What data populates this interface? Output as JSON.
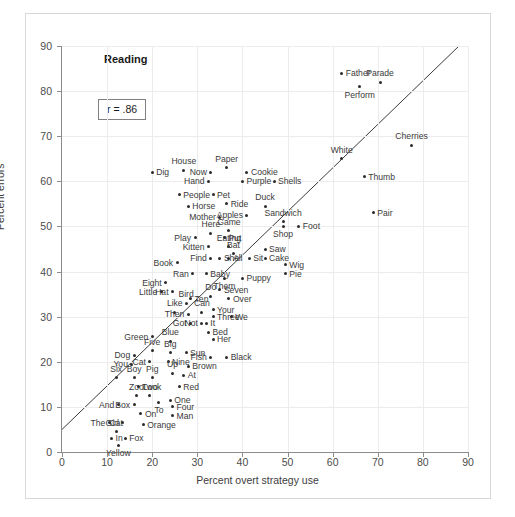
{
  "figure": {
    "title": "Reading",
    "annotation": "r = .86",
    "border_color": "#d8d8d8",
    "point_color": "#2b2b2b",
    "grid_color": "#ececec",
    "axis_color": "#8c8c8c"
  },
  "chart_data": {
    "type": "scatter",
    "title": "Reading",
    "xlabel": "Percent overt strategy use",
    "ylabel": "Percent errors",
    "xlim": [
      0,
      90
    ],
    "ylim": [
      0,
      90
    ],
    "xticks": [
      0,
      10,
      20,
      30,
      40,
      50,
      60,
      70,
      80,
      90
    ],
    "yticks": [
      0,
      10,
      20,
      30,
      40,
      50,
      60,
      70,
      80,
      90
    ],
    "grid": true,
    "legend": "none",
    "annotations": [
      "r = .86"
    ],
    "correlation": 0.86,
    "trendline": {
      "x0": 0,
      "y0": 5,
      "x1": 88,
      "y1": 90
    },
    "points": [
      {
        "label": "Father",
        "x": 62.0,
        "y": 84.0,
        "pos": "r"
      },
      {
        "label": "Parade",
        "x": 70.5,
        "y": 82.0,
        "pos": "t"
      },
      {
        "label": "Perform",
        "x": 66.0,
        "y": 81.0,
        "pos": "b"
      },
      {
        "label": "Cherries",
        "x": 77.5,
        "y": 68.0,
        "pos": "t"
      },
      {
        "label": "White",
        "x": 62.0,
        "y": 65.0,
        "pos": "t"
      },
      {
        "label": "Thumb",
        "x": 67.0,
        "y": 61.0,
        "pos": "r"
      },
      {
        "label": "Pair",
        "x": 69.0,
        "y": 53.0,
        "pos": "r"
      },
      {
        "label": "Dig",
        "x": 20.0,
        "y": 62.0,
        "pos": "r"
      },
      {
        "label": "House",
        "x": 27.0,
        "y": 62.5,
        "pos": "t"
      },
      {
        "label": "Paper",
        "x": 36.5,
        "y": 63.0,
        "pos": "t"
      },
      {
        "label": "Now",
        "x": 33.0,
        "y": 62.0,
        "pos": "l"
      },
      {
        "label": "Cookie",
        "x": 41.0,
        "y": 62.0,
        "pos": "r"
      },
      {
        "label": "Hand",
        "x": 32.5,
        "y": 60.0,
        "pos": "l"
      },
      {
        "label": "Purple",
        "x": 40.0,
        "y": 60.0,
        "pos": "r"
      },
      {
        "label": "Shells",
        "x": 47.0,
        "y": 60.0,
        "pos": "r"
      },
      {
        "label": "People",
        "x": 26.0,
        "y": 57.0,
        "pos": "r"
      },
      {
        "label": "Pet",
        "x": 33.5,
        "y": 57.0,
        "pos": "r"
      },
      {
        "label": "Ride",
        "x": 36.5,
        "y": 55.0,
        "pos": "r"
      },
      {
        "label": "Horse",
        "x": 28.0,
        "y": 54.5,
        "pos": "r"
      },
      {
        "label": "Duck",
        "x": 45.0,
        "y": 54.5,
        "pos": "t"
      },
      {
        "label": "Mother",
        "x": 35.0,
        "y": 52.0,
        "pos": "l"
      },
      {
        "label": "Apples",
        "x": 41.0,
        "y": 52.5,
        "pos": "l"
      },
      {
        "label": "Sandwich",
        "x": 49.0,
        "y": 51.0,
        "pos": "t"
      },
      {
        "label": "Foot",
        "x": 52.5,
        "y": 50.0,
        "pos": "r"
      },
      {
        "label": "Shop",
        "x": 49.0,
        "y": 50.0,
        "pos": "b"
      },
      {
        "label": "Game",
        "x": 37.0,
        "y": 49.0,
        "pos": "t"
      },
      {
        "label": "Here",
        "x": 33.0,
        "y": 48.5,
        "pos": "t"
      },
      {
        "label": "Play",
        "x": 29.5,
        "y": 47.5,
        "pos": "l"
      },
      {
        "label": "Put",
        "x": 36.0,
        "y": 47.5,
        "pos": "r"
      },
      {
        "label": "Eating",
        "x": 37.0,
        "y": 45.5,
        "pos": "t"
      },
      {
        "label": "Kitten",
        "x": 32.5,
        "y": 45.5,
        "pos": "l"
      },
      {
        "label": "Bat",
        "x": 38.0,
        "y": 44.0,
        "pos": "t"
      },
      {
        "label": "Saw",
        "x": 45.0,
        "y": 45.0,
        "pos": "r"
      },
      {
        "label": "Cake",
        "x": 45.0,
        "y": 43.0,
        "pos": "r"
      },
      {
        "label": "Find",
        "x": 33.0,
        "y": 43.0,
        "pos": "l"
      },
      {
        "label": "She",
        "x": 35.0,
        "y": 43.0,
        "pos": "r"
      },
      {
        "label": "All",
        "x": 37.0,
        "y": 43.0,
        "pos": "r"
      },
      {
        "label": "Sit",
        "x": 41.5,
        "y": 43.0,
        "pos": "r"
      },
      {
        "label": "Book",
        "x": 25.5,
        "y": 42.0,
        "pos": "l"
      },
      {
        "label": "Wig",
        "x": 49.5,
        "y": 41.5,
        "pos": "r"
      },
      {
        "label": "Pie",
        "x": 49.5,
        "y": 39.5,
        "pos": "r"
      },
      {
        "label": "Ran",
        "x": 29.0,
        "y": 39.5,
        "pos": "l"
      },
      {
        "label": "Baby",
        "x": 32.0,
        "y": 39.5,
        "pos": "r"
      },
      {
        "label": "Puppy",
        "x": 40.0,
        "y": 38.5,
        "pos": "r"
      },
      {
        "label": "Them",
        "x": 36.0,
        "y": 38.5,
        "pos": "b"
      },
      {
        "label": "Seven",
        "x": 35.0,
        "y": 36.0,
        "pos": "r"
      },
      {
        "label": "Do",
        "x": 33.0,
        "y": 34.5,
        "pos": "t"
      },
      {
        "label": "Over",
        "x": 37.0,
        "y": 34.0,
        "pos": "r"
      },
      {
        "label": "Ten",
        "x": 28.5,
        "y": 34.0,
        "pos": "r"
      },
      {
        "label": "Hat",
        "x": 24.5,
        "y": 35.5,
        "pos": "l"
      },
      {
        "label": "Little",
        "x": 22.0,
        "y": 35.5,
        "pos": "l"
      },
      {
        "label": "Eight",
        "x": 23.0,
        "y": 37.5,
        "pos": "l"
      },
      {
        "label": "Bird",
        "x": 27.5,
        "y": 33.0,
        "pos": "t"
      },
      {
        "label": "Like",
        "x": 25.0,
        "y": 31.0,
        "pos": "t"
      },
      {
        "label": "Then",
        "x": 28.0,
        "y": 30.5,
        "pos": "l"
      },
      {
        "label": "Can",
        "x": 31.0,
        "y": 31.0,
        "pos": "t"
      },
      {
        "label": "Your",
        "x": 33.5,
        "y": 31.5,
        "pos": "r"
      },
      {
        "label": "Three",
        "x": 33.5,
        "y": 30.0,
        "pos": "r"
      },
      {
        "label": "We",
        "x": 37.5,
        "y": 30.0,
        "pos": "r"
      },
      {
        "label": "Got",
        "x": 28.5,
        "y": 28.5,
        "pos": "l"
      },
      {
        "label": "Not",
        "x": 31.0,
        "y": 28.5,
        "pos": "l"
      },
      {
        "label": "It",
        "x": 32.0,
        "y": 28.5,
        "pos": "r"
      },
      {
        "label": "Bed",
        "x": 32.5,
        "y": 26.5,
        "pos": "r"
      },
      {
        "label": "Her",
        "x": 33.5,
        "y": 25.0,
        "pos": "r"
      },
      {
        "label": "Green",
        "x": 20.0,
        "y": 25.5,
        "pos": "l"
      },
      {
        "label": "Blue",
        "x": 24.0,
        "y": 24.5,
        "pos": "t"
      },
      {
        "label": "Five",
        "x": 20.0,
        "y": 22.5,
        "pos": "t"
      },
      {
        "label": "Big",
        "x": 24.0,
        "y": 22.0,
        "pos": "t"
      },
      {
        "label": "Sun",
        "x": 27.5,
        "y": 22.0,
        "pos": "r"
      },
      {
        "label": "Dog",
        "x": 16.0,
        "y": 21.5,
        "pos": "l"
      },
      {
        "label": "Fish",
        "x": 33.0,
        "y": 21.0,
        "pos": "l"
      },
      {
        "label": "Black",
        "x": 36.5,
        "y": 21.0,
        "pos": "r"
      },
      {
        "label": "Nine",
        "x": 23.5,
        "y": 20.0,
        "pos": "r"
      },
      {
        "label": "Cat",
        "x": 19.5,
        "y": 20.0,
        "pos": "l"
      },
      {
        "label": "You",
        "x": 15.5,
        "y": 19.5,
        "pos": "l"
      },
      {
        "label": "Brown",
        "x": 28.0,
        "y": 19.0,
        "pos": "r"
      },
      {
        "label": "Up",
        "x": 24.5,
        "y": 17.5,
        "pos": "t"
      },
      {
        "label": "At",
        "x": 27.0,
        "y": 17.0,
        "pos": "r"
      },
      {
        "label": "Six",
        "x": 12.0,
        "y": 16.5,
        "pos": "t"
      },
      {
        "label": "Boy",
        "x": 16.0,
        "y": 16.5,
        "pos": "t"
      },
      {
        "label": "Pig",
        "x": 20.0,
        "y": 16.5,
        "pos": "t"
      },
      {
        "label": "Look",
        "x": 17.0,
        "y": 14.5,
        "pos": "r"
      },
      {
        "label": "Red",
        "x": 26.0,
        "y": 14.5,
        "pos": "r"
      },
      {
        "label": "Zoo",
        "x": 16.5,
        "y": 12.5,
        "pos": "t"
      },
      {
        "label": "Two",
        "x": 19.5,
        "y": 12.5,
        "pos": "t"
      },
      {
        "label": "One",
        "x": 24.0,
        "y": 11.5,
        "pos": "r"
      },
      {
        "label": "To",
        "x": 21.5,
        "y": 11.0,
        "pos": "b"
      },
      {
        "label": "And",
        "x": 12.5,
        "y": 10.5,
        "pos": "l"
      },
      {
        "label": "Box",
        "x": 16.0,
        "y": 10.5,
        "pos": "l"
      },
      {
        "label": "Four",
        "x": 24.5,
        "y": 10.0,
        "pos": "r"
      },
      {
        "label": "On",
        "x": 17.5,
        "y": 8.5,
        "pos": "r"
      },
      {
        "label": "Man",
        "x": 24.5,
        "y": 8.0,
        "pos": "r"
      },
      {
        "label": "The",
        "x": 10.5,
        "y": 6.5,
        "pos": "l"
      },
      {
        "label": "Girl",
        "x": 13.5,
        "y": 6.5,
        "pos": "l"
      },
      {
        "label": "Orange",
        "x": 18.0,
        "y": 6.0,
        "pos": "r"
      },
      {
        "label": "Cat ",
        "x": 12.0,
        "y": 4.5,
        "pos": "t"
      },
      {
        "label": "In",
        "x": 11.0,
        "y": 3.0,
        "pos": "r"
      },
      {
        "label": "Fox",
        "x": 14.0,
        "y": 3.0,
        "pos": "r"
      },
      {
        "label": "Yellow",
        "x": 12.5,
        "y": 1.5,
        "pos": "b"
      }
    ]
  }
}
